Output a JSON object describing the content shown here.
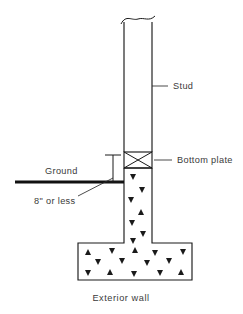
{
  "figure": {
    "title": "Exterior wall",
    "type": "construction-section-diagram",
    "background_color": "#ffffff",
    "line_color": "#1a1a1a",
    "text_color": "#3a3a3a"
  },
  "labels": {
    "stud": "Stud",
    "bottom_plate": "Bottom plate",
    "ground": "Ground",
    "clearance": "8\" or less",
    "caption": "Exterior wall"
  },
  "parts": [
    {
      "id": "stud",
      "name": "Stud",
      "description": "Vertical wood framing member shown with a break line at its top",
      "label": "Stud"
    },
    {
      "id": "bottom-plate",
      "name": "Bottom plate",
      "description": "Horizontal plate with an X through it resting on the concrete stem wall",
      "label": "Bottom plate"
    },
    {
      "id": "ground",
      "name": "Ground",
      "description": "Heavy horizontal line representing finished grade",
      "label": "Ground"
    },
    {
      "id": "clearance-dimension",
      "name": "8\" or less",
      "description": "Vertical dimension from grade up to the bottom plate",
      "label": "8\" or less"
    },
    {
      "id": "stem-wall",
      "name": "Concrete stem wall",
      "description": "Concrete stem wall shown with aggregate hatching"
    },
    {
      "id": "footing",
      "name": "Concrete spread footing",
      "description": "Wide concrete footing shown with aggregate hatching"
    }
  ],
  "geometry": {
    "stud": {
      "left": 124,
      "right": 152,
      "top": 18,
      "bottom": 152
    },
    "bottom_plate": {
      "left": 124,
      "right": 152,
      "top": 152,
      "bottom": 168
    },
    "stem_wall": {
      "left": 124,
      "right": 152,
      "top": 168,
      "bottom": 243
    },
    "footing": {
      "left": 78,
      "right": 192,
      "top": 243,
      "bottom": 280
    },
    "ground_line": {
      "x1": 15,
      "x2": 124,
      "y": 182
    },
    "dimension_line": {
      "x": 113,
      "y_top": 155,
      "y_bottom": 182
    }
  },
  "aggregate_marks": {
    "stem_wall": [
      {
        "x": 133,
        "y": 177,
        "dir": "down"
      },
      {
        "x": 142,
        "y": 190,
        "dir": "down"
      },
      {
        "x": 131,
        "y": 200,
        "dir": "down"
      },
      {
        "x": 141,
        "y": 212,
        "dir": "up"
      },
      {
        "x": 132,
        "y": 223,
        "dir": "down"
      },
      {
        "x": 143,
        "y": 234,
        "dir": "down"
      },
      {
        "x": 133,
        "y": 241,
        "dir": "down"
      }
    ],
    "footing": [
      {
        "x": 88,
        "y": 252,
        "dir": "up"
      },
      {
        "x": 112,
        "y": 251,
        "dir": "down"
      },
      {
        "x": 135,
        "y": 250,
        "dir": "up"
      },
      {
        "x": 155,
        "y": 253,
        "dir": "down"
      },
      {
        "x": 183,
        "y": 252,
        "dir": "down"
      },
      {
        "x": 98,
        "y": 262,
        "dir": "down"
      },
      {
        "x": 122,
        "y": 261,
        "dir": "down"
      },
      {
        "x": 147,
        "y": 263,
        "dir": "down"
      },
      {
        "x": 169,
        "y": 261,
        "dir": "down"
      },
      {
        "x": 88,
        "y": 273,
        "dir": "down"
      },
      {
        "x": 110,
        "y": 272,
        "dir": "up"
      },
      {
        "x": 134,
        "y": 274,
        "dir": "down"
      },
      {
        "x": 160,
        "y": 273,
        "dir": "down"
      },
      {
        "x": 181,
        "y": 272,
        "dir": "up"
      }
    ]
  }
}
